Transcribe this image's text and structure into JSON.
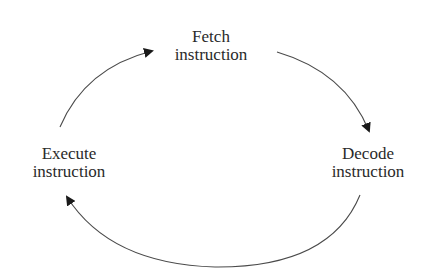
{
  "diagram": {
    "type": "cycle",
    "nodes": [
      {
        "id": "fetch",
        "lines": [
          "Fetch",
          "instruction"
        ]
      },
      {
        "id": "decode",
        "lines": [
          "Decode",
          "instruction"
        ]
      },
      {
        "id": "execute",
        "lines": [
          "Execute",
          "instruction"
        ]
      }
    ],
    "edges": [
      {
        "from": "fetch",
        "to": "decode"
      },
      {
        "from": "decode",
        "to": "execute"
      },
      {
        "from": "execute",
        "to": "fetch"
      }
    ],
    "colors": {
      "line": "#4a4a4a",
      "arrowhead": "#1a1a1a",
      "text": "#2a2a2a",
      "background": "#ffffff"
    }
  }
}
